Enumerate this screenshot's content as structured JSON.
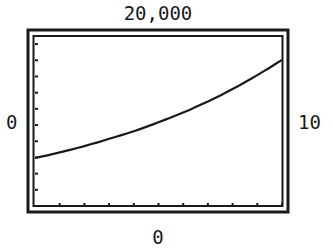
{
  "chart_data": {
    "type": "line",
    "title": "",
    "xlabel": "",
    "ylabel": "",
    "window_labels": {
      "ymax": "20,000",
      "ymin": "0",
      "xmin": "0",
      "xmax": "10"
    },
    "xlim": [
      0,
      10
    ],
    "ylim": [
      0,
      20000
    ],
    "x_ticks_count": 10,
    "y_ticks_count": 10,
    "grid": false,
    "legend": null,
    "series": [
      {
        "name": "y",
        "x": [
          0,
          1,
          2,
          3,
          4,
          5,
          6,
          7,
          8,
          9,
          10
        ],
        "values": [
          5650,
          6300,
          7050,
          7900,
          8800,
          9850,
          11000,
          12300,
          13750,
          15400,
          17200
        ]
      }
    ],
    "colors": {
      "frame": "#1a1a1a",
      "curve": "#1a1a1a",
      "background": "#ffffff"
    }
  }
}
